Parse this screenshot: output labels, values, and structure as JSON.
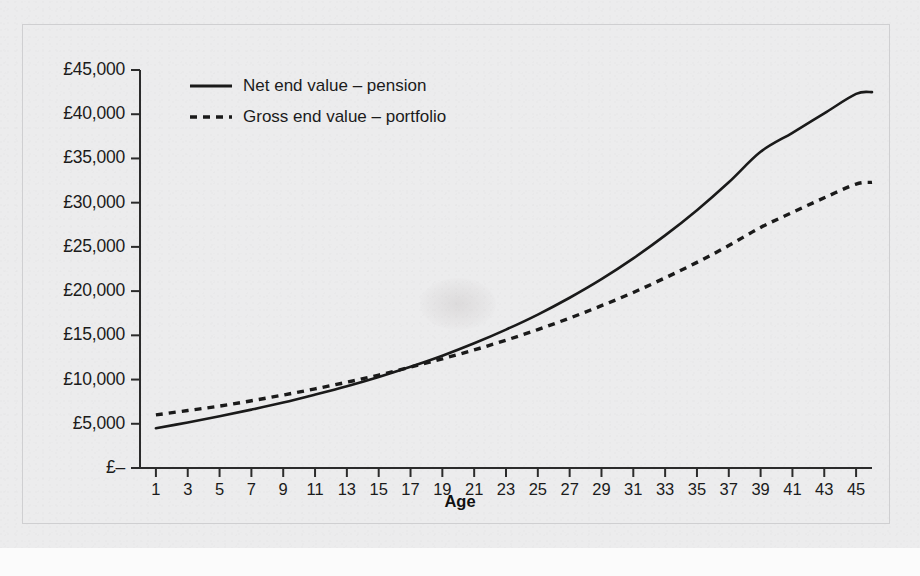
{
  "chart_data": {
    "type": "line",
    "title": "",
    "xlabel": "Age",
    "ylabel": "",
    "xlim": [
      0,
      46
    ],
    "ylim": [
      0,
      45000
    ],
    "grid": false,
    "legend_position": "top-left",
    "y_ticks": [
      0,
      5000,
      10000,
      15000,
      20000,
      25000,
      30000,
      35000,
      40000,
      45000
    ],
    "y_ticklabels": [
      "£–",
      "£5,000",
      "£10,000",
      "£15,000",
      "£20,000",
      "£25,000",
      "£30,000",
      "£35,000",
      "£40,000",
      "£45,000"
    ],
    "x_ticks": [
      1,
      3,
      5,
      7,
      9,
      11,
      13,
      15,
      17,
      19,
      21,
      23,
      25,
      27,
      29,
      31,
      33,
      35,
      37,
      39,
      41,
      43,
      45
    ],
    "x_ticklabels": [
      "1",
      "3",
      "5",
      "7",
      "9",
      "11",
      "13",
      "15",
      "17",
      "19",
      "21",
      "23",
      "25",
      "27",
      "29",
      "31",
      "33",
      "35",
      "37",
      "39",
      "41",
      "43",
      "45"
    ],
    "x": [
      1,
      3,
      5,
      7,
      9,
      11,
      13,
      15,
      17,
      19,
      21,
      23,
      25,
      27,
      29,
      31,
      33,
      35,
      37,
      39,
      41,
      43,
      45,
      46
    ],
    "series": [
      {
        "name": "Net end value – pension",
        "style": "solid",
        "color": "#1a1a1a",
        "values": [
          4500,
          5150,
          5850,
          6600,
          7400,
          8300,
          9250,
          10300,
          11450,
          12700,
          14100,
          15650,
          17350,
          19250,
          21350,
          23700,
          26300,
          29150,
          32300,
          35750,
          37900,
          40100,
          42300,
          42500
        ]
      },
      {
        "name": "Gross end value – portfolio",
        "style": "dashed",
        "color": "#1a1a1a",
        "values": [
          6000,
          6500,
          7000,
          7600,
          8250,
          8950,
          9700,
          10500,
          11400,
          12350,
          13350,
          14450,
          15650,
          16950,
          18350,
          19850,
          21500,
          23250,
          25150,
          27200,
          28900,
          30550,
          32100,
          32300
        ]
      }
    ],
    "annotations": {
      "crossover_age": 23,
      "crossover_value": 13700
    }
  },
  "axis": {
    "x_title": "Age"
  },
  "legend": {
    "entries": [
      {
        "label": "Net end value – pension",
        "style": "solid"
      },
      {
        "label": "Gross end value – portfolio",
        "style": "dashed"
      }
    ]
  },
  "colors": {
    "line": "#1a1a1a",
    "axis": "#2b2b2b",
    "background": "#ececed",
    "frame": "#cfcfd1"
  }
}
